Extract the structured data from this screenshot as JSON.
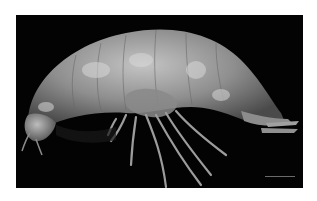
{
  "image": {
    "subject": "amphipod crustacean, lateral view",
    "background_color": "#030303",
    "frame_color": "#ffffff",
    "body_color": "#9a9a9a",
    "highlight_color": "#d0d0d0",
    "scale_bar": {
      "visible": true,
      "label": ""
    }
  }
}
